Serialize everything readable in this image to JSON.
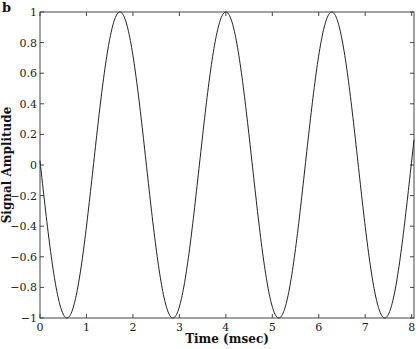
{
  "panel_label": "b",
  "chart_data": {
    "type": "line",
    "title": "",
    "xlabel": "Time (msec)",
    "ylabel": "Signal Amplitude",
    "xlim": [
      0,
      8.05
    ],
    "ylim": [
      -1,
      1
    ],
    "xticks": [
      0,
      1,
      2,
      3,
      4,
      5,
      6,
      7,
      8
    ],
    "yticks": [
      -1,
      -0.8,
      -0.6,
      -0.4,
      -0.2,
      0,
      0.2,
      0.4,
      0.6,
      0.8,
      1
    ],
    "ytick_labels": [
      "−1",
      "−0.8",
      "−0.6",
      "−0.4",
      "−0.2",
      "0",
      "0.2",
      "0.4",
      "0.6",
      "0.8",
      "1"
    ],
    "grid": false,
    "legend": null,
    "series": [
      {
        "name": "signal",
        "function": "cosine",
        "amplitude": 1,
        "period_ms": 2.28,
        "peak_times_ms": [
          1.72,
          4.0,
          6.28
        ],
        "trough_times_ms": [
          0.57,
          2.85,
          5.13,
          7.41
        ],
        "x": [
          0,
          0.57,
          1.14,
          1.72,
          2.29,
          2.85,
          3.43,
          4.0,
          4.57,
          5.13,
          5.71,
          6.28,
          6.85,
          7.41,
          7.98,
          8.05
        ],
        "y": [
          0.0,
          -1.0,
          0.0,
          1.0,
          0.0,
          -1.0,
          0.0,
          1.0,
          0.0,
          -1.0,
          0.0,
          1.0,
          0.0,
          -1.0,
          0.0,
          0.3
        ],
        "color": "#222222"
      }
    ]
  }
}
